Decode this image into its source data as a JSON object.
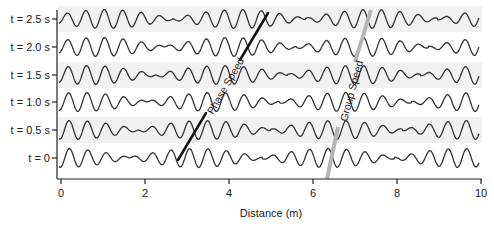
{
  "chart_data": {
    "type": "line",
    "title": "",
    "xlabel": "Distance (m)",
    "ylabel": "",
    "xlim": [
      0,
      10
    ],
    "xticks": [
      0,
      2,
      4,
      6,
      8,
      10
    ],
    "grid": false,
    "legend": null,
    "row_labels": [
      "t = 2.5 s",
      "t = 2.0 s",
      "t = 1.5 s",
      "t = 1.0 s",
      "t = 0.5 s",
      "t = 0"
    ],
    "times": [
      2.5,
      2.0,
      1.5,
      1.0,
      0.5,
      0
    ],
    "wave_model": {
      "description": "superposition of two sinusoids producing wave groups (beats)",
      "carrier_wavelength_m": 0.44,
      "group_spacing_m": 3.15,
      "phase_speed_m_per_s": 0.86,
      "group_speed_m_per_s": 0.41,
      "group_center_at_t0_m": 6.36
    },
    "annotations": [
      {
        "text": "Phase Speed",
        "line": {
          "t0_x": 2.8,
          "t2_5_x": 4.95
        },
        "color": "#111111"
      },
      {
        "text": "Group Speed",
        "line": {
          "t0_x": 6.36,
          "t2_5_x": 7.38
        },
        "color": "#b8b8b8"
      }
    ]
  },
  "colors": {
    "wave": "#333333",
    "axis": "#222222",
    "band": "#f1f1f1",
    "phase_line": "#111111",
    "group_line": "#b5b5b5"
  }
}
